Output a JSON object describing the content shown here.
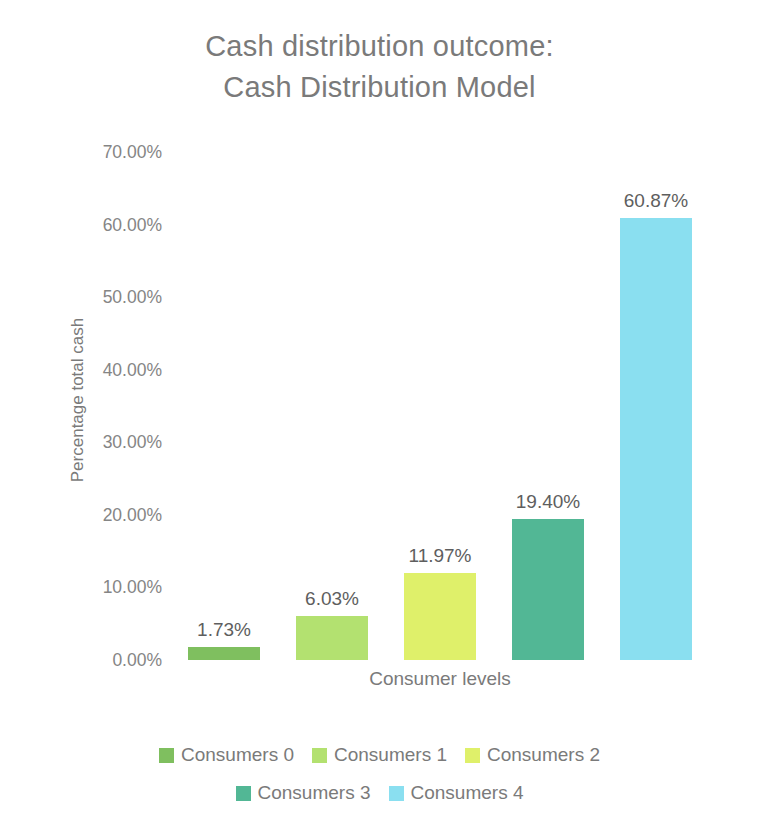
{
  "chart_data": {
    "type": "bar",
    "title": "Cash distribution outcome: Cash Distribution Model",
    "title_lines": [
      "Cash distribution outcome:",
      "Cash Distribution Model"
    ],
    "xlabel": "Consumer levels",
    "ylabel": "Percentage total cash",
    "categories": [
      "Consumers 0",
      "Consumers 1",
      "Consumers 2",
      "Consumers 3",
      "Consumers 4"
    ],
    "values": [
      1.73,
      6.03,
      11.97,
      19.4,
      60.87
    ],
    "data_labels": [
      "1.73%",
      "6.03%",
      "11.97%",
      "19.40%",
      "60.87%"
    ],
    "colors": [
      "#7fbf5f",
      "#b3e170",
      "#dff06a",
      "#52b795",
      "#8adff0"
    ],
    "ylim": [
      0,
      70
    ],
    "ytick_values": [
      70,
      60,
      50,
      40,
      30,
      20,
      10,
      0
    ],
    "ytick_labels": [
      "70.00%",
      "60.00%",
      "50.00%",
      "40.00%",
      "30.00%",
      "20.00%",
      "10.00%",
      "0.00%"
    ],
    "grid": false,
    "legend_position": "bottom",
    "legend_rows": [
      [
        "Consumers 0",
        "Consumers 1",
        "Consumers 2"
      ],
      [
        "Consumers 3",
        "Consumers 4"
      ]
    ]
  }
}
